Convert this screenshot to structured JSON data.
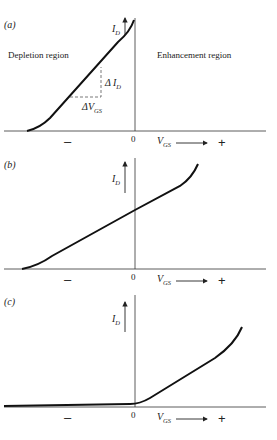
{
  "panels": [
    {
      "label": "(a)",
      "y_axis": "I_D",
      "x_axis": "V_GS",
      "origin": "0",
      "minus": "–",
      "plus": "+",
      "regions": {
        "left": "Depletion region",
        "right": "Enhancement region"
      },
      "annotations": {
        "delta_id": "ΔI_D",
        "delta_vgs": "ΔV_GS"
      }
    },
    {
      "label": "(b)",
      "y_axis": "I_D",
      "x_axis": "V_GS",
      "origin": "0",
      "minus": "–",
      "plus": "+"
    },
    {
      "label": "(c)",
      "y_axis": "I_D",
      "x_axis": "V_GS",
      "origin": "0",
      "minus": "–",
      "plus": "+"
    }
  ],
  "text": {
    "a_label": "(a)",
    "b_label": "(b)",
    "c_label": "(c)",
    "I": "I",
    "D": "D",
    "V": "V",
    "GS": "GS",
    "zero": "0",
    "minus": "–",
    "plus": "+",
    "depletion": "Depletion region",
    "enhancement": "Enhancement region",
    "delta": "Δ"
  }
}
